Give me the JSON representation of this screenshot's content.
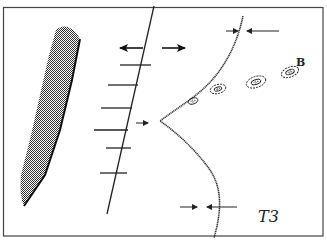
{
  "figure": {
    "type": "structural-geology-sketch",
    "labels": {
      "boudin_label": "B",
      "panel_label": "T3"
    },
    "colors": {
      "ink": "#222222",
      "frame": "#444444",
      "background": "#ffffff",
      "hatch": "#333333"
    },
    "elements": {
      "hatched_body": "stippled elongate body",
      "fault": "ticked fault line with extension arrows",
      "curved_boundary": "dotted curved contact with cusp",
      "boudins": 4,
      "width_markers": 2
    }
  }
}
